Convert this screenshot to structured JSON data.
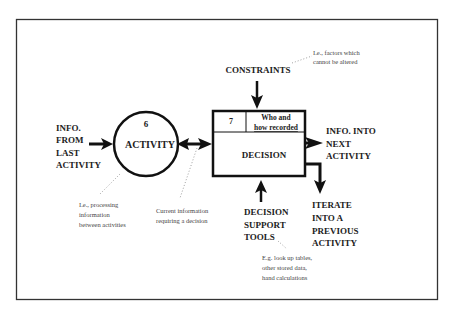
{
  "diagram": {
    "type": "process-flow",
    "frame_color": "#333333",
    "line_color": "#111111",
    "activity": {
      "number": "6",
      "label": "ACTIVITY"
    },
    "decision": {
      "number": "7",
      "header_line1": "Who and",
      "header_line2": "how recorded",
      "label": "DECISION"
    },
    "inputs": {
      "from_last": [
        "INFO.",
        "FROM",
        "LAST",
        "ACTIVITY"
      ],
      "constraints": "CONSTRAINTS",
      "support_tools": [
        "DECISION",
        "SUPPORT",
        "TOOLS"
      ]
    },
    "outputs": {
      "next": [
        "INFO. INTO",
        "NEXT",
        "ACTIVITY"
      ],
      "iterate": [
        "ITERATE",
        "INTO A",
        "PREVIOUS",
        "ACTIVITY"
      ]
    },
    "notes": {
      "constraints": [
        "I.e., factors which",
        "cannot be altered"
      ],
      "activity": [
        "I.e., processing",
        "information",
        "between activities"
      ],
      "current_info": [
        "Current information",
        "requiring a decision"
      ],
      "support_tools": [
        "E.g. look up tables,",
        "other stored data,",
        "hand calculations"
      ]
    }
  }
}
